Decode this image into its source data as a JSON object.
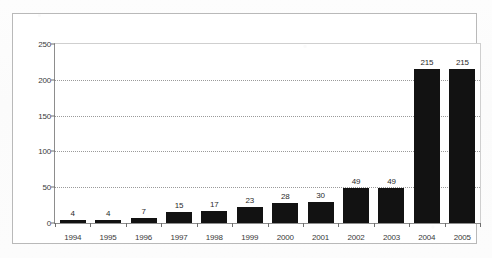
{
  "chart_data": {
    "type": "bar",
    "title": "",
    "subtitle": "",
    "xlabel": "",
    "ylabel": "",
    "categories": [
      "1994",
      "1995",
      "1996",
      "1997",
      "1998",
      "1999",
      "2000",
      "2001",
      "2002",
      "2003",
      "2004",
      "2005"
    ],
    "values": [
      4,
      4,
      7,
      15,
      17,
      23,
      28,
      30,
      49,
      49,
      215,
      215
    ],
    "value_labels": [
      "4",
      "4",
      "7",
      "15",
      "17",
      "23",
      "28",
      "30",
      "49",
      "49",
      "215",
      "215"
    ],
    "ylim": [
      0,
      250
    ],
    "yticks": [
      0,
      50,
      100,
      150,
      200,
      250
    ],
    "ytick_labels": [
      "0",
      "50",
      "100",
      "150",
      "200",
      "250"
    ],
    "grid": "horizontal-dotted",
    "legend": null,
    "legend_position": "none",
    "series": [
      {
        "name": "",
        "values": [
          4,
          4,
          7,
          15,
          17,
          23,
          28,
          30,
          49,
          49,
          215,
          215
        ],
        "color": "#121212"
      }
    ]
  },
  "colors": {
    "bar": "#121212",
    "axis": "#8d8d8d",
    "grid": "#9a9a9a",
    "frame": "#b9b9b9",
    "text": "#2b2b2b",
    "plot_background": "#ffffff",
    "page_background": "#fcfcfc"
  }
}
